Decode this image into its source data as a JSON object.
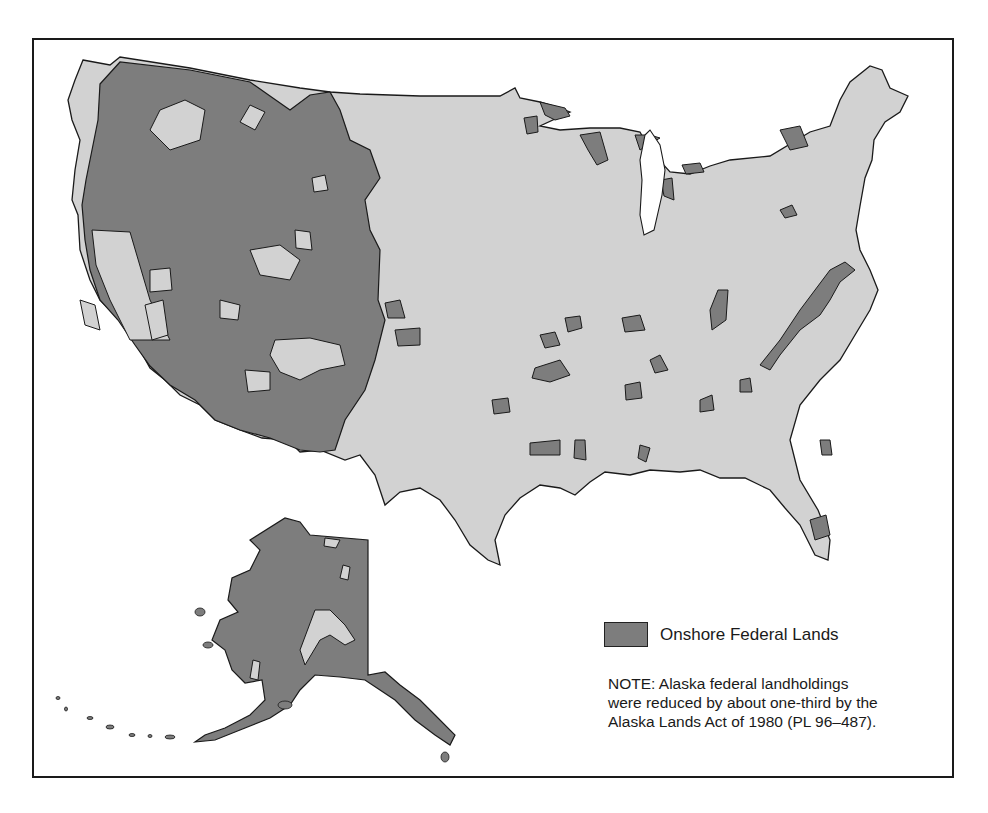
{
  "map": {
    "subject": "Onshore Federal Lands of the United States",
    "colors": {
      "federal_land": "#7d7d7d",
      "non_federal_land": "#d2d2d2",
      "water": "#ffffff",
      "outline": "#1a1a1a"
    },
    "regions_shown": [
      "Contiguous United States",
      "Alaska (inset)"
    ]
  },
  "legend": {
    "items": [
      {
        "label": "Onshore Federal Lands",
        "color": "#7d7d7d"
      }
    ]
  },
  "note": {
    "lines": [
      "NOTE: Alaska federal landholdings",
      "were reduced by about one-third by the",
      "Alaska Lands Act of 1980 (PL 96–487)."
    ]
  }
}
